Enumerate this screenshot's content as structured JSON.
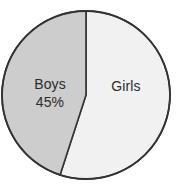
{
  "chart_data": {
    "type": "pie",
    "title": "",
    "subtitle": "",
    "xlabel": "",
    "ylabel": "",
    "legend": "none",
    "grid": false,
    "categories": [
      "Boys",
      "Girls"
    ],
    "values": [
      45,
      55
    ],
    "units": "percent",
    "start_angle_deg": 0,
    "direction": "counterclockwise",
    "slices": [
      {
        "name": "Boys",
        "label": "Boys",
        "value": 45,
        "value_label": "45%",
        "show_value_label": true,
        "fill": "#cdcdcd",
        "stroke": "#333333"
      },
      {
        "name": "Girls",
        "label": "Girls",
        "value": 55,
        "value_label": "",
        "show_value_label": false,
        "fill": "#f1f1f1",
        "stroke": "#333333"
      }
    ],
    "annotations": []
  },
  "figure": {
    "background": "#ffffff",
    "outline_color": "#333333",
    "text_color": "#2b2b2b",
    "center_x": 86,
    "center_y": 95,
    "radius": 84
  }
}
